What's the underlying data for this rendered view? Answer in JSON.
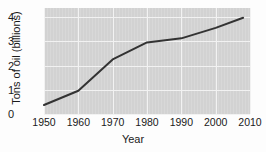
{
  "chart_data": {
    "type": "line",
    "title": "",
    "xlabel": "Year",
    "ylabel": "Tons of oil (billions)",
    "xlim": [
      1950,
      2010
    ],
    "ylim": [
      0,
      4
    ],
    "grid": true,
    "legend": "none",
    "x_ticks": [
      "1950",
      "1960",
      "1970",
      "1980",
      "1990",
      "2000",
      "2010"
    ],
    "y_ticks": [
      "0",
      "1",
      "2",
      "3",
      "4"
    ],
    "x": [
      1950,
      1960,
      1970,
      1980,
      1990,
      2000,
      2008
    ],
    "series": [
      {
        "name": "Tons of oil (billions)",
        "color": "#333333",
        "values": [
          0.37,
          0.96,
          2.25,
          2.95,
          3.12,
          3.55,
          3.97
        ]
      }
    ]
  },
  "style": {
    "plot_background": "#d2d2d2",
    "grid_color": "#f2f2f2",
    "page_background": "#fdfdfd",
    "text_color": "#1a1a1a"
  }
}
